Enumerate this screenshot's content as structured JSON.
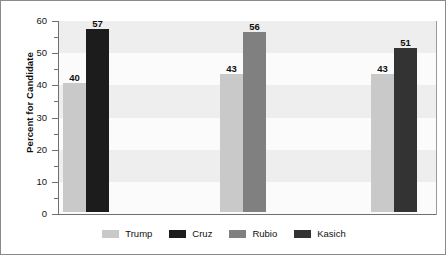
{
  "chart_data": {
    "type": "bar",
    "title": "",
    "subtitle": "",
    "xlabel": "",
    "ylabel": "Percent for Candidate",
    "ylim": [
      0,
      60
    ],
    "ytick_step": 10,
    "yminor_step": 5,
    "ytick_labels": [
      "0",
      "10",
      "20",
      "30",
      "40",
      "50",
      "60"
    ],
    "grid": false,
    "background_bands": true,
    "legend_position": "bottom",
    "categories": [
      "Matchup 1",
      "Matchup 2",
      "Matchup 3"
    ],
    "series": [
      {
        "name": "Trump",
        "color": "#c9c9c9",
        "values": [
          40,
          43,
          43
        ]
      },
      {
        "name": "Cruz",
        "color": "#1c1c1c",
        "values": [
          57,
          null,
          null
        ]
      },
      {
        "name": "Rubio",
        "color": "#808080",
        "values": [
          null,
          56,
          null
        ]
      },
      {
        "name": "Kasich",
        "color": "#333333",
        "values": [
          null,
          null,
          51
        ]
      }
    ],
    "bars": [
      {
        "series": "Trump",
        "value": 40,
        "label": "40",
        "color": "#c9c9c9",
        "group": 0
      },
      {
        "series": "Cruz",
        "value": 57,
        "label": "57",
        "color": "#1c1c1c",
        "group": 0
      },
      {
        "series": "Trump",
        "value": 43,
        "label": "43",
        "color": "#c9c9c9",
        "group": 1
      },
      {
        "series": "Rubio",
        "value": 56,
        "label": "56",
        "color": "#808080",
        "group": 1
      },
      {
        "series": "Trump",
        "value": 43,
        "label": "43",
        "color": "#c9c9c9",
        "group": 2
      },
      {
        "series": "Kasich",
        "value": 51,
        "label": "51",
        "color": "#333333",
        "group": 2
      }
    ]
  },
  "legend": {
    "items": [
      {
        "label": "Trump",
        "color": "#c9c9c9"
      },
      {
        "label": "Cruz",
        "color": "#1c1c1c"
      },
      {
        "label": "Rubio",
        "color": "#808080"
      },
      {
        "label": "Kasich",
        "color": "#333333"
      }
    ]
  },
  "axis": {
    "y_title": "Percent for Candidate",
    "y_ticks": [
      "60",
      "50",
      "40",
      "30",
      "20",
      "10",
      "0"
    ]
  },
  "colors": {
    "frame": "#8a8a8a",
    "axis": "#6f6f6f",
    "plot_bg": "#fbfbfb",
    "band_bg": "#eeeeee",
    "text": "#101010"
  }
}
